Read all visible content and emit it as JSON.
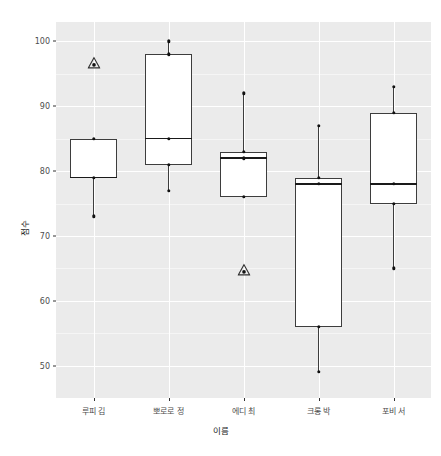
{
  "chart_data": {
    "type": "box",
    "title": "",
    "xlabel": "이름",
    "ylabel": "점수",
    "ylim": [
      45,
      103
    ],
    "yticks": [
      50,
      60,
      70,
      80,
      90,
      100
    ],
    "ytick_labels": [
      "50",
      "60",
      "70",
      "80",
      "90",
      "100"
    ],
    "yminor": [
      55,
      65,
      75,
      85,
      95
    ],
    "grid": true,
    "legend": "none",
    "categories": [
      "루피 김",
      "뽀로로 정",
      "에디 최",
      "크롱 박",
      "포비 서"
    ],
    "boxes": [
      {
        "category": "루피 김",
        "q1": 79,
        "median": 79,
        "q3": 85,
        "whisker_low": 73,
        "whisker_high": 85,
        "points": [
          85,
          79,
          73
        ],
        "outliers": [
          97
        ]
      },
      {
        "category": "뽀로로 정",
        "q1": 81,
        "median": 85,
        "q3": 98,
        "whisker_low": 77,
        "whisker_high": 100,
        "points": [
          100,
          98,
          85,
          81,
          77
        ],
        "outliers": []
      },
      {
        "category": "에디 최",
        "q1": 76,
        "median": 82,
        "q3": 83,
        "whisker_low": 76,
        "whisker_high": 92,
        "points": [
          92,
          83,
          82,
          76
        ],
        "outliers": [
          65
        ]
      },
      {
        "category": "크롱 박",
        "q1": 56,
        "median": 78,
        "q3": 79,
        "whisker_low": 49,
        "whisker_high": 87,
        "points": [
          87,
          79,
          78,
          56,
          49
        ],
        "outliers": []
      },
      {
        "category": "포비 서",
        "q1": 75,
        "median": 78,
        "q3": 89,
        "whisker_low": 65,
        "whisker_high": 93,
        "points": [
          93,
          89,
          78,
          75,
          65
        ],
        "outliers": []
      }
    ],
    "colors": {
      "panel_background": "#ebebeb",
      "grid_major": "#ffffff",
      "grid_minor": "#f5f5f5",
      "box_fill": "#ffffff",
      "box_border": "#3d3d3d",
      "median": "#1a1a1a",
      "point": "#111111",
      "outlier": "#333333",
      "axis_text": "#4d4d4d",
      "title_text": "#1a1a1a"
    }
  }
}
